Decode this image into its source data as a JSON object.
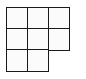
{
  "grid": {
    "rows": 3,
    "cols": 3,
    "line_color": "#1a1a1a",
    "cell_fill": "#fbfbfb",
    "cells": [
      {
        "row": 0,
        "col": 0,
        "x": 6,
        "y": 7
      },
      {
        "row": 0,
        "col": 1,
        "x": 27,
        "y": 7
      },
      {
        "row": 0,
        "col": 2,
        "x": 48,
        "y": 7
      },
      {
        "row": 1,
        "col": 0,
        "x": 6,
        "y": 28
      },
      {
        "row": 1,
        "col": 1,
        "x": 27,
        "y": 28
      },
      {
        "row": 1,
        "col": 2,
        "x": 48,
        "y": 28
      },
      {
        "row": 2,
        "col": 0,
        "x": 6,
        "y": 49
      },
      {
        "row": 2,
        "col": 1,
        "x": 27,
        "y": 49
      }
    ]
  }
}
